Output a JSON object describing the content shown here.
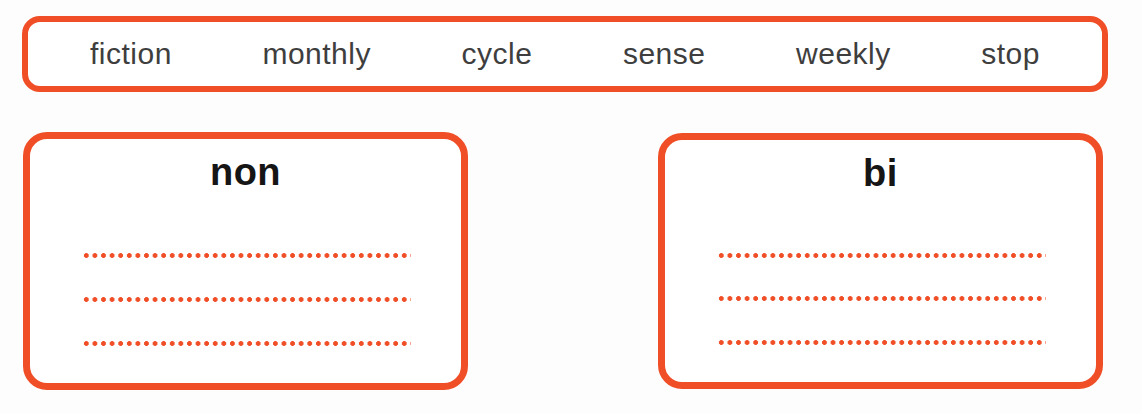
{
  "colors": {
    "accent": "#f04e27",
    "word_text": "#3e3e3e",
    "heading_text": "#151515",
    "background": "#fdfdfd"
  },
  "word_bank": {
    "words": [
      "fiction",
      "monthly",
      "cycle",
      "sense",
      "weekly",
      "stop"
    ]
  },
  "boxes": [
    {
      "heading": "non",
      "answer_lines": 3
    },
    {
      "heading": "bi",
      "answer_lines": 3
    }
  ]
}
